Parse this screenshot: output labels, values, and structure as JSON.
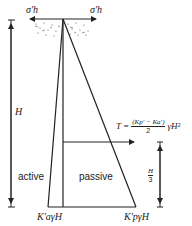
{
  "diagram": {
    "stress_left": "σ′h",
    "stress_right": "σ′h",
    "height_label": "H",
    "active_label": "active",
    "passive_label": "passive",
    "thrust": {
      "lhs": "T =",
      "numerator": "(Kp′ − Ka′)",
      "denominator": "2",
      "rhs": "γH²"
    },
    "third_height": {
      "num": "H",
      "den": "3"
    },
    "active_base": "K′aγH",
    "passive_base": "K′pγH"
  }
}
